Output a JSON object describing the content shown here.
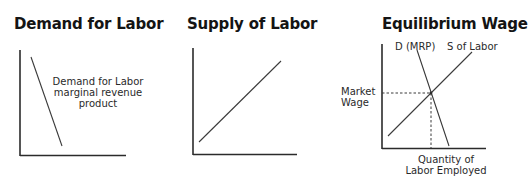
{
  "panels": [
    {
      "title": "Demand for Labor",
      "curve_label_lines": [
        "Demand for Labor",
        "marginal revenue",
        "product"
      ]
    },
    {
      "title": "Supply of Labor"
    },
    {
      "title": "Equilibrium Wage",
      "demand_label": "D (MRP)",
      "supply_label": "S of Labor",
      "y_label_lines": [
        "Market",
        "Wage"
      ],
      "x_label_lines": [
        "Quantity of",
        "Labor Employed"
      ]
    }
  ],
  "colors": {
    "axis": "#2b2b2b",
    "curve": "#3a3a3a",
    "guide": "#3a3a3a"
  }
}
